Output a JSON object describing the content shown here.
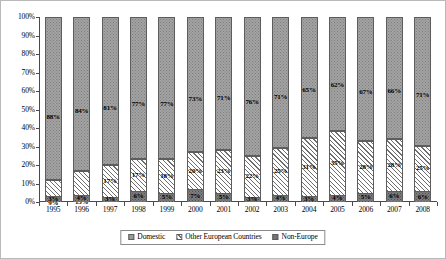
{
  "chart_data": {
    "type": "bar",
    "subtype": "stacked-percentage-column",
    "title": "",
    "subtitle": "",
    "xlabel": "",
    "ylabel": "",
    "ylim": [
      0,
      100
    ],
    "grid": false,
    "legend_position": "bottom",
    "categories": [
      "1995",
      "1996",
      "1997",
      "1998",
      "1999",
      "2000",
      "2001",
      "2002",
      "2003",
      "2004",
      "2005",
      "2006",
      "2007",
      "2008"
    ],
    "y_ticks": [
      "0%",
      "10%",
      "20%",
      "30%",
      "40%",
      "50%",
      "60%",
      "70%",
      "80%",
      "90%",
      "100%"
    ],
    "y_tick_values": [
      0,
      10,
      20,
      30,
      40,
      50,
      60,
      70,
      80,
      90,
      100
    ],
    "series": [
      {
        "name": "Domestic",
        "pattern": "grey-stipple",
        "color": "#a3a3a3",
        "values": [
          88,
          84,
          81,
          77,
          77,
          73,
          71,
          76,
          71,
          65,
          62,
          67,
          66,
          71
        ],
        "labels": [
          "88%",
          "84%",
          "81%",
          "77%",
          "77%",
          "73%",
          "71%",
          "76%",
          "71%",
          "65%",
          "62%",
          "67%",
          "66%",
          "71%"
        ]
      },
      {
        "name": "Other European Countries",
        "pattern": "diagonal-hatch",
        "color": "#ffffff",
        "values": [
          9,
          13,
          17,
          17,
          18,
          20,
          23,
          22,
          25,
          31,
          35,
          28,
          28,
          25
        ],
        "labels": [
          "9%",
          "13%",
          "17%",
          "17%",
          "18%",
          "20%",
          "23%",
          "22%",
          "25%",
          "31%",
          "35%",
          "28%",
          "28%",
          "25%"
        ]
      },
      {
        "name": "Non-Europe",
        "pattern": "dark-grey-stipple",
        "color": "#7e7e7e",
        "values": [
          3,
          4,
          3,
          6,
          5,
          7,
          5,
          3,
          4,
          3,
          4,
          5,
          6,
          6
        ],
        "labels": [
          "3%",
          "4%",
          "3%",
          "6%",
          "5%",
          "7%",
          "5%",
          "3%",
          "4%",
          "3%",
          "4%",
          "5%",
          "6%",
          "6%"
        ]
      }
    ]
  },
  "legend": {
    "items": [
      {
        "label": "Domestic"
      },
      {
        "label": "Other European Countries"
      },
      {
        "label": "Non-Europe"
      }
    ]
  }
}
